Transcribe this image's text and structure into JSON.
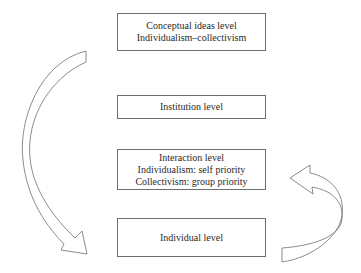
{
  "diagram": {
    "levels": [
      {
        "id": "conceptual",
        "lines": [
          "Conceptual ideas level",
          "Individualism–collectivism"
        ]
      },
      {
        "id": "institution",
        "lines": [
          "Institution level"
        ]
      },
      {
        "id": "interaction",
        "lines": [
          "Interaction level",
          "Individualism: self priority",
          "Collectivism: group priority"
        ]
      },
      {
        "id": "individual",
        "lines": [
          "Individual level"
        ]
      }
    ],
    "arrows": [
      {
        "name": "top-down-arrow",
        "from": "conceptual",
        "to": "individual",
        "side": "left",
        "direction": "down"
      },
      {
        "name": "bottom-up-arrow",
        "from": "individual",
        "to": "interaction",
        "side": "right",
        "direction": "up"
      }
    ],
    "colors": {
      "stroke": "#6e6e6e",
      "background": "#ffffff",
      "text": "#2a2a2a"
    }
  }
}
